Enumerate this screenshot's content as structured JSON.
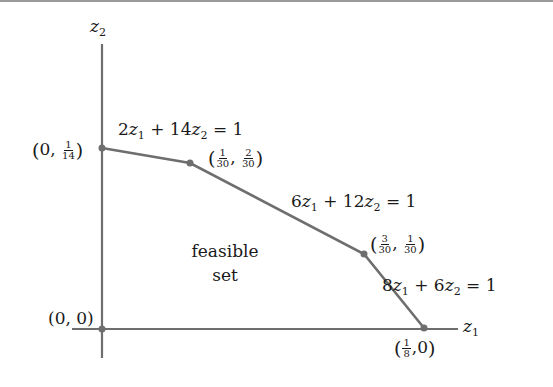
{
  "axes": {
    "x_label": "z",
    "x_sub": "1",
    "y_label": "z",
    "y_sub": "2"
  },
  "region_label": {
    "line1": "feasible",
    "line2": "set"
  },
  "constraints": [
    {
      "id": "c1",
      "a": "2",
      "b": "14",
      "rhs": "1"
    },
    {
      "id": "c2",
      "a": "6",
      "b": "12",
      "rhs": "1"
    },
    {
      "id": "c3",
      "a": "8",
      "b": "6",
      "rhs": "1"
    }
  ],
  "vertices": [
    {
      "id": "v0",
      "x": "0",
      "y": "0"
    },
    {
      "id": "v1",
      "x": "0",
      "y_num": "1",
      "y_den": "14"
    },
    {
      "id": "v2",
      "x_num": "1",
      "x_den": "30",
      "y_num": "2",
      "y_den": "30"
    },
    {
      "id": "v3",
      "x_num": "3",
      "x_den": "30",
      "y_num": "1",
      "y_den": "30"
    },
    {
      "id": "v4",
      "x_num": "1",
      "x_den": "8",
      "y": "0"
    }
  ],
  "colors": {
    "line": "#6e6e6e",
    "text": "#1a1a1a"
  },
  "symbols": {
    "plus": "+",
    "equals": "=",
    "open": "(",
    "close": ")",
    "comma": ","
  }
}
